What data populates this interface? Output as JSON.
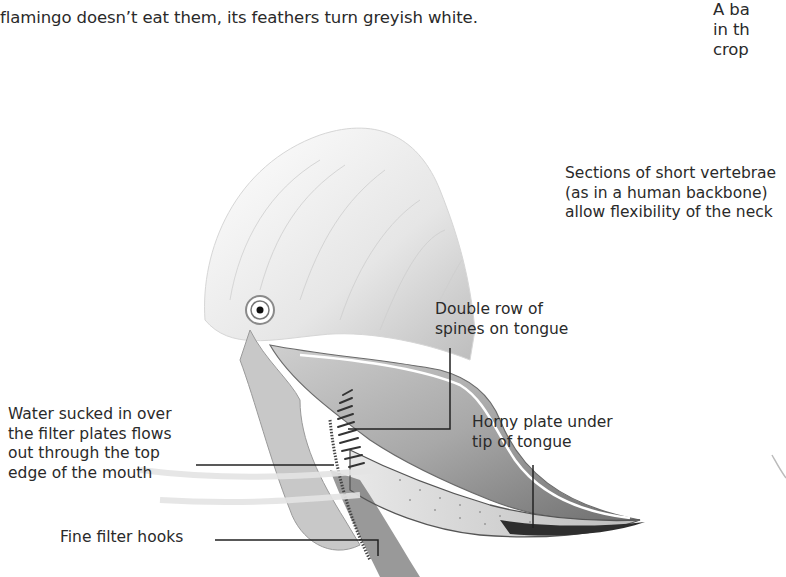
{
  "intro_text": {
    "line1": "flamingo doesn’t eat them, its feathers turn greyish white."
  },
  "side_note": {
    "lines": [
      "A ba",
      "in th",
      "crop"
    ]
  },
  "illustration": {
    "subject": "flamingo-head-cross-section",
    "colors": {
      "ink": "#2a2a2a",
      "shade": "#9a9a9a",
      "light": "#d8d8d8"
    }
  },
  "callouts": [
    {
      "id": "vertebrae",
      "lines": [
        "Sections of short vertebrae",
        "(as in a human backbone)",
        "allow flexibility of the neck"
      ]
    },
    {
      "id": "spines",
      "lines": [
        "Double row of",
        "spines on tongue"
      ]
    },
    {
      "id": "water",
      "lines": [
        "Water sucked in over",
        "the filter plates flows",
        "out through the top",
        "edge of the mouth"
      ]
    },
    {
      "id": "horny-plate",
      "lines": [
        "Horny plate under",
        "tip of tongue"
      ]
    },
    {
      "id": "filter-hooks",
      "lines": [
        "Fine filter hooks"
      ]
    }
  ]
}
